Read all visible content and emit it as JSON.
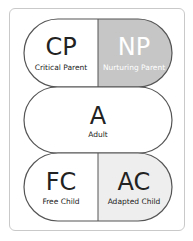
{
  "header_fragment": "",
  "colors": {
    "frame_border": "#c9c9c9",
    "outline": "#555555",
    "np_fill": "#c6c6c6",
    "ac_fill": "#eeeeee",
    "white": "#ffffff",
    "text_dark": "#222222",
    "text_light": "#ffffff"
  },
  "ego_states": {
    "parent": {
      "critical": {
        "abbr": "CP",
        "label": "Critical Parent"
      },
      "nurturing": {
        "abbr": "NP",
        "label": "Nurturing Parent"
      }
    },
    "adult": {
      "abbr": "A",
      "label": "Adult"
    },
    "child": {
      "free": {
        "abbr": "FC",
        "label": "Free Child"
      },
      "adapted": {
        "abbr": "AC",
        "label": "Adapted Child"
      }
    }
  }
}
